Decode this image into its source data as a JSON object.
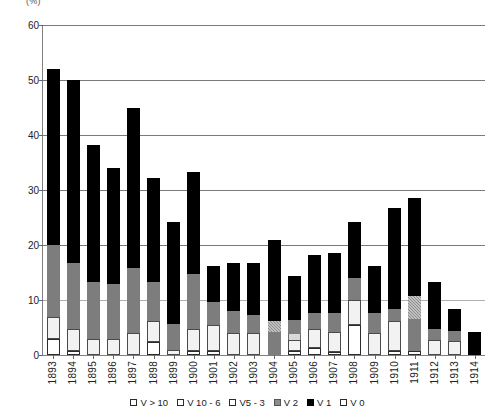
{
  "chart_data": {
    "type": "bar",
    "title": "",
    "units_label": "(%)",
    "xlabel": "",
    "ylabel": "",
    "ylim": [
      0,
      60
    ],
    "yticks": [
      0,
      10,
      20,
      30,
      40,
      50,
      60
    ],
    "grid": true,
    "stacked": true,
    "legend_position": "bottom",
    "categories": [
      "1893",
      "1894",
      "1895",
      "1896",
      "1897",
      "1898",
      "1899",
      "1900",
      "1901",
      "1902",
      "1903",
      "1904",
      "1905",
      "1906",
      "1907",
      "1908",
      "1909",
      "1910",
      "1911",
      "1912",
      "1913",
      "1914"
    ],
    "series": [
      {
        "name": "V 1",
        "key": "v1",
        "color": "#000000",
        "values": [
          32.0,
          33.3,
          25.0,
          21.0,
          29.2,
          18.8,
          18.6,
          18.5,
          6.6,
          8.7,
          9.4,
          14.8,
          8.0,
          10.5,
          10.8,
          10.2,
          8.6,
          18.3,
          17.8,
          8.6,
          4.0,
          4.2
        ]
      },
      {
        "name": "V 2",
        "key": "v2",
        "color": "#8c8c8c",
        "values": [
          0.0,
          0.0,
          0.0,
          0.0,
          0.0,
          0.0,
          0.0,
          0.0,
          0.0,
          0.0,
          0.0,
          2.0,
          0.0,
          0.0,
          0.0,
          0.0,
          0.0,
          0.0,
          4.2,
          0.0,
          0.0,
          0.0
        ]
      },
      {
        "name": "V5 - 3",
        "key": "v53",
        "color": "#7d7d7d",
        "values": [
          13.0,
          12.0,
          10.2,
          10.0,
          11.8,
          7.2,
          4.6,
          10.0,
          4.2,
          4.0,
          3.3,
          4.2,
          2.6,
          3.0,
          3.5,
          4.0,
          3.6,
          2.2,
          5.8,
          1.9,
          1.8,
          0.0
        ]
      },
      {
        "name": "V 10 - 6",
        "key": "v106",
        "color": "#d9d9d9",
        "values": [
          0.0,
          0.0,
          0.0,
          0.0,
          0.0,
          0.0,
          0.0,
          0.0,
          0.0,
          0.0,
          0.0,
          0.0,
          1.0,
          0.0,
          0.0,
          0.0,
          0.0,
          0.0,
          0.0,
          0.0,
          0.0,
          0.0
        ]
      },
      {
        "name": "V > 10",
        "key": "vgt10",
        "color": "#f2f2f2",
        "values": [
          4.0,
          4.0,
          3.0,
          3.0,
          4.0,
          3.8,
          1.0,
          4.0,
          4.6,
          4.0,
          4.0,
          0.0,
          2.0,
          3.4,
          3.6,
          4.6,
          4.0,
          5.5,
          0.0,
          2.8,
          2.5,
          0.0
        ]
      },
      {
        "name": "V 0",
        "key": "v0",
        "color": "#ffffff",
        "values": [
          3.0,
          0.7,
          0.0,
          0.0,
          0.0,
          2.3,
          0.0,
          0.7,
          0.8,
          0.0,
          0.0,
          0.0,
          0.8,
          1.3,
          0.6,
          5.4,
          0.0,
          0.7,
          0.8,
          0.0,
          0.0,
          0.0
        ]
      }
    ],
    "totals": [
      52.0,
      50.0,
      38.2,
      34.0,
      45.0,
      32.1,
      24.2,
      33.2,
      16.2,
      16.7,
      16.7,
      21.0,
      14.4,
      18.2,
      18.5,
      24.2,
      16.2,
      26.7,
      28.6,
      13.3,
      8.3,
      4.2
    ],
    "legend": [
      {
        "label": "V > 10",
        "key": "vgt10"
      },
      {
        "label": "V 10 - 6",
        "key": "v106"
      },
      {
        "label": "V5 - 3",
        "key": "v53"
      },
      {
        "label": "V 2",
        "key": "v2"
      },
      {
        "label": "V 1",
        "key": "v1"
      },
      {
        "label": "V 0",
        "key": "v0"
      }
    ],
    "stack_order": [
      "v0",
      "vgt10",
      "v106",
      "v53",
      "v2",
      "v1"
    ]
  }
}
